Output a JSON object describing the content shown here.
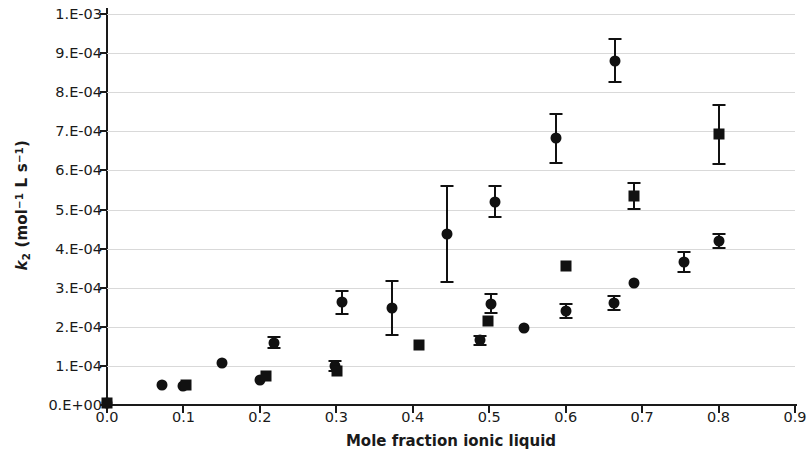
{
  "chart_data": {
    "type": "scatter",
    "title": "",
    "xlabel": "Mole fraction ionic liquid",
    "ylabel": "k2 (mol^-1 L s^-1)",
    "xlim": [
      0.0,
      0.9
    ],
    "ylim": [
      0.0,
      0.001
    ],
    "grid": true,
    "legend": "none",
    "xticks": [
      "0.0",
      "0.1",
      "0.2",
      "0.3",
      "0.4",
      "0.5",
      "0.6",
      "0.7",
      "0.8",
      "0.9"
    ],
    "xtick_values": [
      0.0,
      0.1,
      0.2,
      0.3,
      0.4,
      0.5,
      0.6,
      0.7,
      0.8,
      0.9
    ],
    "yticks": [
      "0.E+00",
      "1.E-04",
      "2.E-04",
      "3.E-04",
      "4.E-04",
      "5.E-04",
      "6.E-04",
      "7.E-04",
      "8.E-04",
      "9.E-04",
      "1.E-03"
    ],
    "ytick_values": [
      0.0,
      0.0001,
      0.0002,
      0.0003,
      0.0004,
      0.0005,
      0.0006,
      0.0007,
      0.0008,
      0.0009,
      0.001
    ],
    "marker_color": "#111111",
    "grid_color": "#d9d9d9",
    "axis_color": "#1a1a1a",
    "series": [
      {
        "name": "circle-series",
        "marker": "circle",
        "points": [
          {
            "x": 0.0,
            "y": 5e-06,
            "yerr": 0.0
          },
          {
            "x": 0.072,
            "y": 5e-05,
            "yerr": 0.0
          },
          {
            "x": 0.1,
            "y": 4.9e-05,
            "yerr": 0.0
          },
          {
            "x": 0.15,
            "y": 0.000107,
            "yerr": 0.0
          },
          {
            "x": 0.2,
            "y": 6.4e-05,
            "yerr": 0.0
          },
          {
            "x": 0.218,
            "y": 0.000159,
            "yerr": 1.4e-05
          },
          {
            "x": 0.298,
            "y": 0.0001,
            "yerr": 1.3e-05
          },
          {
            "x": 0.307,
            "y": 0.000263,
            "yerr": 2.9e-05
          },
          {
            "x": 0.373,
            "y": 0.000248,
            "yerr": 7e-05
          },
          {
            "x": 0.445,
            "y": 0.000438,
            "yerr": 0.000123
          },
          {
            "x": 0.488,
            "y": 0.000165,
            "yerr": 1.1e-05
          },
          {
            "x": 0.502,
            "y": 0.000259,
            "yerr": 2.4e-05
          },
          {
            "x": 0.508,
            "y": 0.00052,
            "yerr": 4e-05
          },
          {
            "x": 0.545,
            "y": 0.000196,
            "yerr": 0.0
          },
          {
            "x": 0.6,
            "y": 0.00024,
            "yerr": 1.8e-05
          },
          {
            "x": 0.588,
            "y": 0.000682,
            "yerr": 6.2e-05
          },
          {
            "x": 0.663,
            "y": 0.000261,
            "yerr": 1.9e-05
          },
          {
            "x": 0.665,
            "y": 0.000881,
            "yerr": 5.6e-05
          },
          {
            "x": 0.69,
            "y": 0.000312,
            "yerr": 0.0
          },
          {
            "x": 0.755,
            "y": 0.000365,
            "yerr": 2.6e-05
          },
          {
            "x": 0.8,
            "y": 0.00042,
            "yerr": 1.8e-05
          }
        ]
      },
      {
        "name": "square-series",
        "marker": "square",
        "points": [
          {
            "x": 0.0,
            "y": 5e-06,
            "yerr": 0.0
          },
          {
            "x": 0.103,
            "y": 5.2e-05,
            "yerr": 0.0
          },
          {
            "x": 0.208,
            "y": 7.3e-05,
            "yerr": 0.0
          },
          {
            "x": 0.301,
            "y": 8.8e-05,
            "yerr": 0.0
          },
          {
            "x": 0.408,
            "y": 0.000154,
            "yerr": 0.0
          },
          {
            "x": 0.498,
            "y": 0.000214,
            "yerr": 0.0
          },
          {
            "x": 0.6,
            "y": 0.000355,
            "yerr": 0.0
          },
          {
            "x": 0.69,
            "y": 0.000535,
            "yerr": 3.3e-05
          },
          {
            "x": 0.8,
            "y": 0.000692,
            "yerr": 7.6e-05
          }
        ]
      }
    ]
  }
}
